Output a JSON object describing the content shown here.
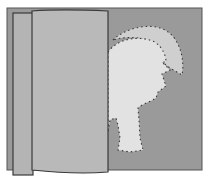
{
  "diagram": {
    "colors": {
      "background": "#ffffff",
      "back_sheet": "#9a9a9a",
      "folded_flap": "#b9b9b9",
      "left_strip": "#b4b4b4",
      "cut_shape": "#e2e2e2",
      "tail_shape": "#cfcfcf",
      "outline": "#4a4a4a",
      "dash": "#3a3a3a"
    }
  }
}
